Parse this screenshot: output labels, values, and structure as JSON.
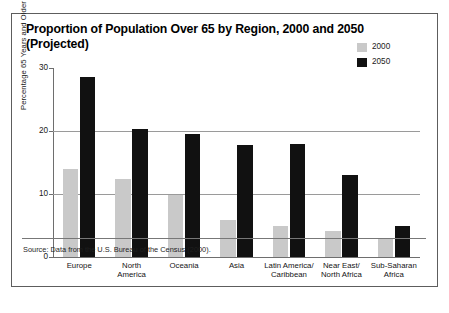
{
  "figure": {
    "title": "Proportion of Population Over 65 by Region, 2000 and 2050 (Projected)",
    "source_note": "Source: Data from the U.S. Bureau of the Census (2000).",
    "accent_2000": "#c9c9c9",
    "accent_2050": "#111111"
  },
  "chart_data": {
    "type": "bar",
    "title": "Proportion of Population Over 65 by Region, 2000 and 2050 (Projected)",
    "xlabel": "",
    "ylabel": "Percentage 65 Years and Older",
    "ylim": [
      0,
      30
    ],
    "yticks": [
      0,
      10,
      20,
      30
    ],
    "ytick_labels": [
      "0",
      "10",
      "20",
      "30"
    ],
    "grid": "horizontal",
    "gridlines_at": [
      10,
      20
    ],
    "legend_position": "upper-right",
    "categories": [
      "Europe",
      "North\nAmerica",
      "Oceania",
      "Asia",
      "Latin America/\nCaribbean",
      "Near East/\nNorth Africa",
      "Sub-Saharan\nAfrica"
    ],
    "series": [
      {
        "name": "2000",
        "color": "#c9c9c9",
        "values": [
          14.0,
          12.4,
          9.9,
          5.8,
          5.0,
          4.2,
          3.0
        ]
      },
      {
        "name": "2050",
        "color": "#111111",
        "values": [
          28.5,
          20.3,
          19.6,
          17.8,
          18.0,
          13.0,
          4.9
        ]
      }
    ]
  }
}
